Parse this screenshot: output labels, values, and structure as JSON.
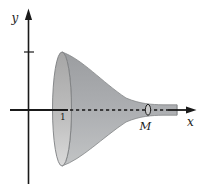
{
  "figure": {
    "name": "solid-of-revolution-horn",
    "labels": {
      "y_axis": "y",
      "x_axis": "x",
      "x_tick_one": "1",
      "section_point": "M"
    },
    "colors": {
      "background": "#ffffff",
      "axis": "#1a1a1a",
      "horn_body_dark": "#9b9da0",
      "horn_body_mid": "#aeb0b3",
      "horn_body_light": "#c2c4c5",
      "mouth_face_top": "#a6a6a6",
      "mouth_face_bottom": "#dadada",
      "outline": "#7d7f81",
      "disk_fill": "#cacaca",
      "disk_outline": "#1f1f1f"
    }
  }
}
